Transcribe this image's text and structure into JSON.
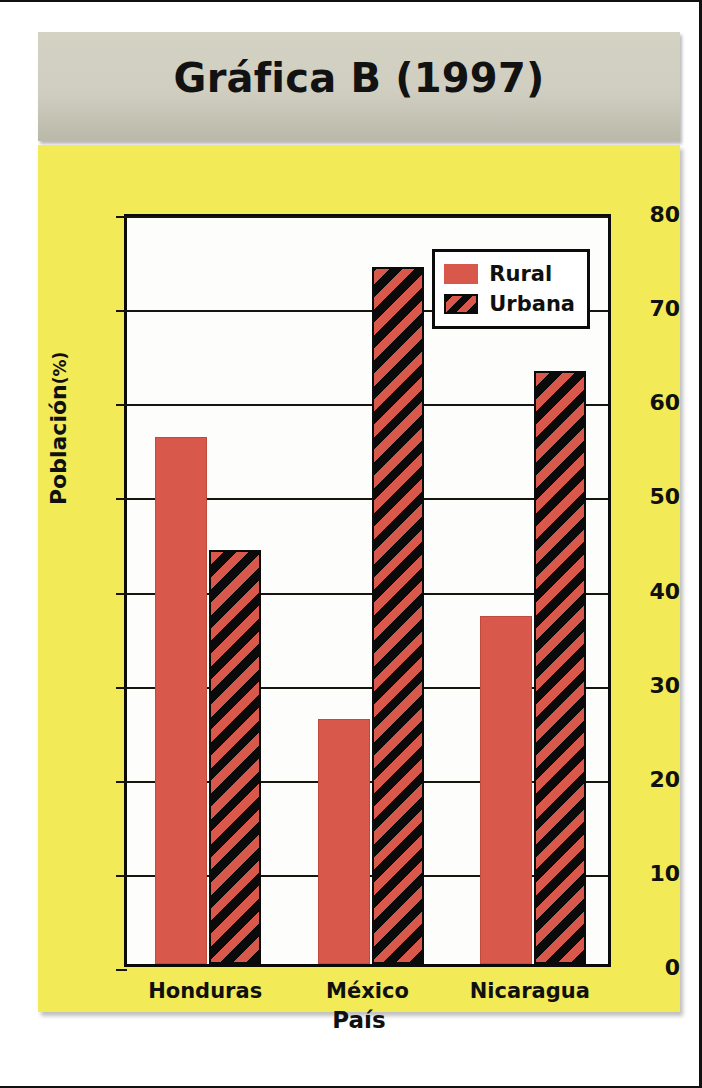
{
  "figure": {
    "title": "Gráfica B (1997)",
    "panel_color": "#f2ea57",
    "title_band_color": "#cfcec0"
  },
  "chart_data": {
    "type": "bar",
    "title": "Gráfica B (1997)",
    "xlabel": "País",
    "ylabel": "Población",
    "ylabel_unit": "(%)",
    "categories": [
      "Honduras",
      "México",
      "Nicaragua"
    ],
    "series": [
      {
        "name": "Rural",
        "color": "#d8584b",
        "pattern": "solid",
        "values": [
          56,
          26,
          37
        ]
      },
      {
        "name": "Urbana",
        "color": "#d8584b",
        "pattern": "diagonal-hatch",
        "values": [
          44,
          74,
          63
        ]
      }
    ],
    "ylim": [
      0,
      80
    ],
    "yticks": [
      0,
      10,
      20,
      30,
      40,
      50,
      60,
      70,
      80
    ],
    "ytick_labels": [
      "0",
      "10",
      "20",
      "30",
      "40",
      "50",
      "60",
      "70",
      "80"
    ],
    "grid": true,
    "legend_position": "top-right",
    "legend_entries": [
      "Rural",
      "Urbana"
    ]
  }
}
